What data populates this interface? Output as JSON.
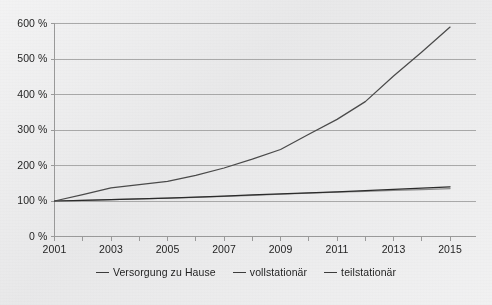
{
  "chart_data": {
    "type": "line",
    "title": "",
    "xlabel": "",
    "ylabel": "",
    "x": [
      2001,
      2002,
      2003,
      2004,
      2005,
      2006,
      2007,
      2008,
      2009,
      2010,
      2011,
      2012,
      2013,
      2014,
      2015
    ],
    "xtick_labels": [
      "2001",
      "2003",
      "2005",
      "2007",
      "2009",
      "2011",
      "2013",
      "2015"
    ],
    "xtick_values": [
      2001,
      2003,
      2005,
      2007,
      2009,
      2011,
      2013,
      2015
    ],
    "xlim": [
      2001,
      2015.9
    ],
    "ytick_labels": [
      "0 %",
      "100 %",
      "200 %",
      "300 %",
      "400 %",
      "500 %",
      "600 %"
    ],
    "ytick_values": [
      0,
      100,
      200,
      300,
      400,
      500,
      600
    ],
    "ylim": [
      0,
      600
    ],
    "grid": "horizontal",
    "legend_position": "bottom-center",
    "series": [
      {
        "name": "Versorgung zu Hause",
        "color": "#4a4a4a",
        "values": [
          100,
          118,
          137,
          146,
          155,
          172,
          193,
          218,
          245,
          288,
          330,
          380,
          452,
          520,
          590
        ]
      },
      {
        "name": "vollstationär",
        "color": "#8c8c8c",
        "values": [
          100,
          102,
          104,
          106,
          108,
          110,
          113,
          116,
          119,
          122,
          125,
          127,
          130,
          132,
          135
        ]
      },
      {
        "name": "teilstationär",
        "color": "#2b2b2b",
        "values": [
          100,
          102,
          104,
          106,
          108,
          111,
          114,
          117,
          120,
          123,
          126,
          129,
          133,
          136,
          140
        ]
      }
    ]
  },
  "axes": {
    "axis_line_color": "#9a9a9a",
    "grid_color": "#a9a9a9"
  },
  "legend": {
    "items": [
      {
        "label": "Versorgung zu Hause"
      },
      {
        "label": "vollstationär"
      },
      {
        "label": "teilstationär"
      }
    ]
  }
}
